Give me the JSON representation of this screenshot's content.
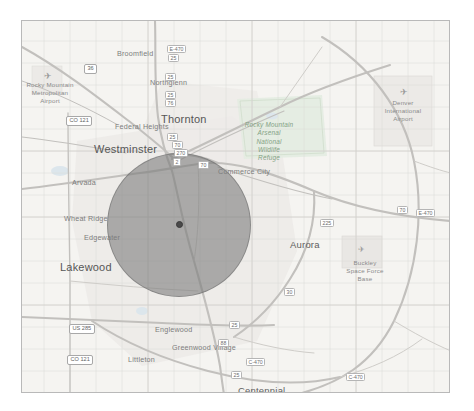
{
  "map": {
    "title": "Denver Metropolitan Area Map",
    "background_color": "#f4f3f0",
    "frame_color": "#b9b9b9",
    "attribution": "",
    "cities": [
      {
        "name": "Broomfield",
        "x": 95,
        "y": 28,
        "size": "small"
      },
      {
        "name": "Northglenn",
        "x": 128,
        "y": 57,
        "size": "small"
      },
      {
        "name": "Thornton",
        "x": 139,
        "y": 92,
        "size": "big"
      },
      {
        "name": "Federal Heights",
        "x": 93,
        "y": 101,
        "size": "small"
      },
      {
        "name": "Westminster",
        "x": 72,
        "y": 122,
        "size": "big"
      },
      {
        "name": "Commerce City",
        "x": 196,
        "y": 146,
        "size": "small"
      },
      {
        "name": "Arvada",
        "x": 50,
        "y": 157,
        "size": "small"
      },
      {
        "name": "Wheat Ridge",
        "x": 42,
        "y": 193,
        "size": "small"
      },
      {
        "name": "Edgewater",
        "x": 62,
        "y": 212,
        "size": "small"
      },
      {
        "name": "Lakewood",
        "x": 38,
        "y": 240,
        "size": "big"
      },
      {
        "name": "Aurora",
        "x": 268,
        "y": 218,
        "size": "major"
      },
      {
        "name": "Englewood",
        "x": 133,
        "y": 304,
        "size": "small"
      },
      {
        "name": "Littleton",
        "x": 106,
        "y": 334,
        "size": "small"
      },
      {
        "name": "Greenwood Village",
        "x": 160,
        "y": 326,
        "size": "small"
      },
      {
        "name": "Centennial",
        "x": 216,
        "y": 364,
        "size": "major"
      }
    ],
    "pois": [
      {
        "name": "Rocky Mountain\nMetropolitan\nAirport",
        "x": 14,
        "y": 64,
        "kind": "airport"
      },
      {
        "name": "Denver\nInternational\nAirport",
        "x": 399,
        "y": 83,
        "kind": "airport"
      },
      {
        "name": "Buckley\nSpace Force\nBase",
        "x": 345,
        "y": 243,
        "kind": "base"
      }
    ],
    "parks": [
      {
        "name": "Rocky Mountain\nArsenal\nNational\nWildlife\nRefuge",
        "x": 245,
        "y": 108,
        "color": "#83a183"
      }
    ],
    "road_shields": [
      {
        "label": "E-470",
        "x": 145,
        "y": 24
      },
      {
        "label": "25",
        "x": 146,
        "y": 33
      },
      {
        "label": "25",
        "x": 143,
        "y": 52
      },
      {
        "label": "25",
        "x": 143,
        "y": 70
      },
      {
        "label": "76",
        "x": 143,
        "y": 78
      },
      {
        "label": "25",
        "x": 145,
        "y": 112
      },
      {
        "label": "70",
        "x": 150,
        "y": 120
      },
      {
        "label": "270",
        "x": 152,
        "y": 128
      },
      {
        "label": "70",
        "x": 176,
        "y": 140
      },
      {
        "label": "2",
        "x": 151,
        "y": 137
      },
      {
        "label": "CO 121",
        "x": 44,
        "y": 95
      },
      {
        "label": "US 285",
        "x": 47,
        "y": 303
      },
      {
        "label": "CO 121",
        "x": 45,
        "y": 334
      },
      {
        "label": "E-470",
        "x": 394,
        "y": 188
      },
      {
        "label": "225",
        "x": 298,
        "y": 198
      },
      {
        "label": "25",
        "x": 207,
        "y": 300
      },
      {
        "label": "C-470",
        "x": 224,
        "y": 337
      },
      {
        "label": "25",
        "x": 209,
        "y": 350
      },
      {
        "label": "C-470",
        "x": 324,
        "y": 352
      },
      {
        "label": "70",
        "x": 375,
        "y": 185
      },
      {
        "label": "36",
        "x": 62,
        "y": 43
      },
      {
        "label": "25",
        "x": 204,
        "y": 385
      },
      {
        "label": "470",
        "x": 276,
        "y": 372
      },
      {
        "label": "88",
        "x": 196,
        "y": 318
      },
      {
        "label": "30",
        "x": 262,
        "y": 267
      }
    ],
    "overlay": {
      "name": "radius-circle",
      "center_x": 178,
      "center_y": 224,
      "radius_px": 72,
      "fill_color": "#787878",
      "fill_opacity": "0.58",
      "center_marker_color": "#4a4a4a"
    }
  }
}
